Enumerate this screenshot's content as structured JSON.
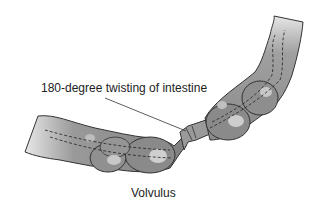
{
  "diagram": {
    "title": "Volvulus",
    "annotations": [
      {
        "text": "180-degree twisting of intestine",
        "points_to": "twisted segment"
      }
    ],
    "colors": {
      "intestine_fill": "#8c8c8c",
      "intestine_light": "#c8c8c8",
      "outline": "#333333",
      "highlight": "#d8d8d8"
    }
  }
}
